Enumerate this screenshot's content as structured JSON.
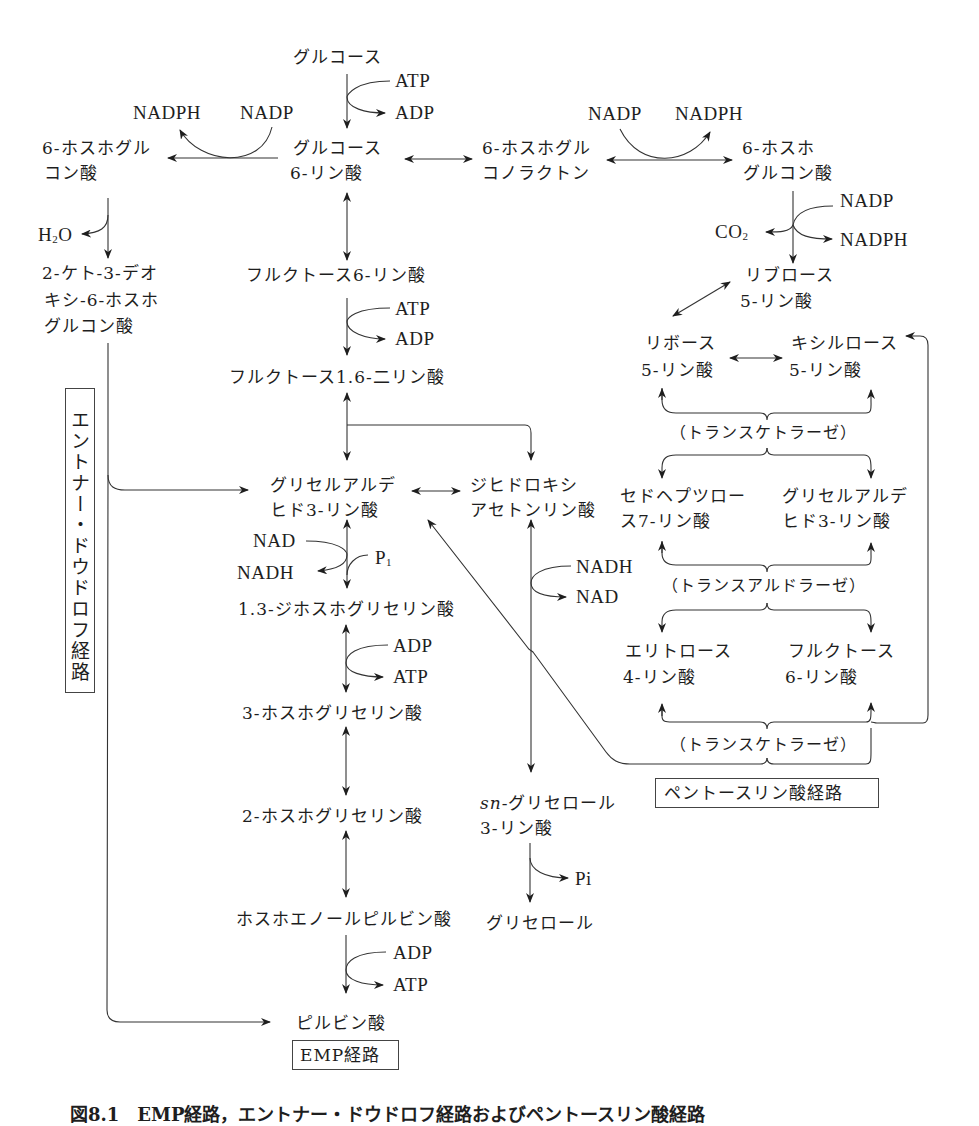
{
  "figure": {
    "caption": "図8.1　EMP経路，エントナー・ドウドロフ経路およびペントースリン酸経路"
  },
  "pathways": {
    "emp": "EMP経路",
    "entner_doudoroff": "エントナー・ドウドロフ経路",
    "pentose_phosphate": "ペントースリン酸経路"
  },
  "compounds": {
    "glucose": "グルコース",
    "g6p_1": "グルコース",
    "g6p_2": "6-リン酸",
    "pgl_1": "6-ホスホグル",
    "pgl_2": "コノラクトン",
    "pg_right_1": "6-ホスホ",
    "pg_right_2": "グルコン酸",
    "pg_left_1": "6-ホスホグル",
    "pg_left_2": "コン酸",
    "kdpg_1": "2-ケト-3-デオ",
    "kdpg_2": "キシ-6-ホスホ",
    "kdpg_3": "グルコン酸",
    "f6p": "フルクトース6-リン酸",
    "fbp": "フルクトース1.6-二リン酸",
    "gap_1": "グリセルアルデ",
    "gap_2": "ヒド3-リン酸",
    "dhap_1": "ジヒドロキシ",
    "dhap_2": "アセトンリン酸",
    "bpg": "1.3-ジホスホグリセリン酸",
    "pg3": "3-ホスホグリセリン酸",
    "pg2": "2-ホスホグリセリン酸",
    "pep": "ホスホエノールピルビン酸",
    "pyruvate": "ピルビン酸",
    "g3p_1_italic": "sn",
    "g3p_1_rest": "-グリセロール",
    "g3p_2": "3-リン酸",
    "glycerol": "グリセロール",
    "ru5p_1": "リブロース",
    "ru5p_2": "5-リン酸",
    "r5p_1": "リボース",
    "r5p_2": "5-リン酸",
    "x5p_1": "キシルロース",
    "x5p_2": "5-リン酸",
    "s7p_1": "セドヘプツロー",
    "s7p_2": "ス7-リン酸",
    "gap_pp_1": "グリセルアルデ",
    "gap_pp_2": "ヒド3-リン酸",
    "e4p_1": "エリトロース",
    "e4p_2": "4-リン酸",
    "f6p_pp_1": "フルクトース",
    "f6p_pp_2": "6-リン酸"
  },
  "enzymes": {
    "transketolase_1": "（トランスケトラーゼ）",
    "transaldolase": "（トランスアルドラーゼ）",
    "transketolase_2": "（トランスケトラーゼ）"
  },
  "cofactors": {
    "atp_1": "ATP",
    "adp_1": "ADP",
    "nadph_left": "NADPH",
    "nadp_left": "NADP",
    "nadp_right": "NADP",
    "nadph_right": "NADPH",
    "nadp_dec": "NADP",
    "co2": "CO",
    "co2_sub": "2",
    "nadph_dec": "NADPH",
    "h2o": "H",
    "h2o_sub": "2",
    "h2o_o": "O",
    "atp_2": "ATP",
    "adp_2": "ADP",
    "nad_1": "NAD",
    "nadh_1": "NADH",
    "pi_1": "P",
    "pi_1_sub": "1",
    "adp_3": "ADP",
    "atp_3": "ATP",
    "nadh_2": "NADH",
    "nad_2": "NAD",
    "pi_2": "Pi",
    "adp_4": "ADP",
    "atp_4": "ATP"
  }
}
